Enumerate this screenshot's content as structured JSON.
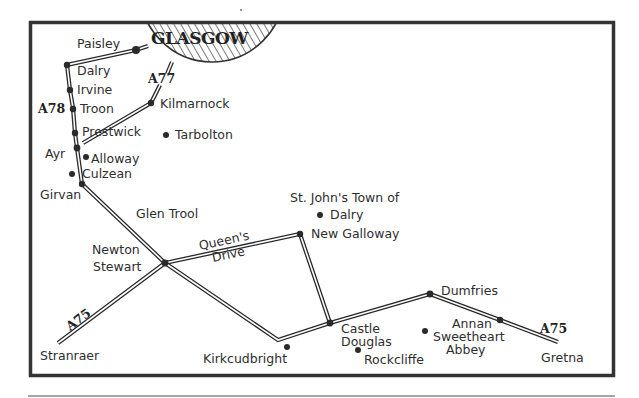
{
  "map": {
    "frame": {
      "x": 30,
      "y": 22,
      "width": 584,
      "height": 354,
      "border_color": "#333333"
    },
    "city": {
      "name": "GLASGOW",
      "hatch_color": "#333333"
    },
    "road_numbers": {
      "a78": "A78",
      "a77": "A77",
      "a75_west": "A75",
      "a75_east": "A75"
    },
    "places": {
      "paisley": "Paisley",
      "dalry_ayrshire": "Dalry",
      "irvine": "Irvine",
      "troon": "Troon",
      "prestwick": "Prestwick",
      "ayr": "Ayr",
      "alloway": "Alloway",
      "culzean": "Culzean",
      "girvan": "Girvan",
      "kilmarnock": "Kilmarnock",
      "tarbolton": "Tarbolton",
      "glen_trool": "Glen Trool",
      "newton": "Newton",
      "stewart": "Stewart",
      "queens": "Queen's",
      "drive": "Drive",
      "st_johns_line1": "St. John's Town of",
      "st_johns_line2": "Dalry",
      "new_galloway": "New Galloway",
      "stranraer": "Stranraer",
      "kirkcudbright": "Kirkcudbright",
      "castle": "Castle",
      "douglas": "Douglas",
      "rockcliffe": "Rockcliffe",
      "dumfries": "Dumfries",
      "annan": "Annan",
      "sweetheart": "Sweetheart",
      "abbey": "Abbey",
      "gretna": "Gretna"
    }
  }
}
